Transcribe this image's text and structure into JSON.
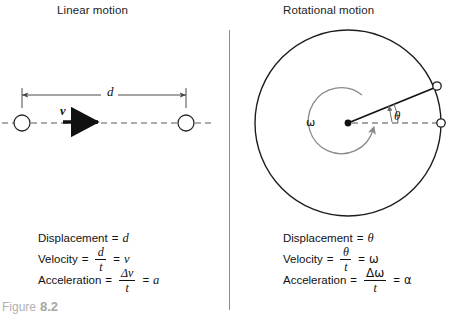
{
  "figure": {
    "caption_prefix": "Figure",
    "caption_number": "8.2",
    "scan_artifact": ""
  },
  "panels": {
    "left": {
      "title": "Linear motion",
      "diagram": {
        "distance_label": "d",
        "velocity_label": "v",
        "marker_left": "particle-start",
        "marker_right": "particle-end"
      },
      "equations": [
        {
          "name": "displacement",
          "label": "Displacement",
          "equals": "=",
          "result": "d",
          "has_fraction": false
        },
        {
          "name": "velocity",
          "label": "Velocity",
          "equals": "=",
          "numerator": "d",
          "denominator": "t",
          "equals2": "=",
          "result": "v",
          "has_fraction": true
        },
        {
          "name": "acceleration",
          "label": "Acceleration",
          "equals": "=",
          "numerator": "Δv",
          "denominator": "t",
          "equals2": "=",
          "result": "a",
          "has_fraction": true
        }
      ]
    },
    "right": {
      "title": "Rotational motion",
      "diagram": {
        "angular_velocity_label": "ω",
        "angle_label": "θ",
        "marker_center": "rotation-center",
        "marker_moved": "point-after-rotation",
        "marker_reference": "point-reference"
      },
      "equations": [
        {
          "name": "displacement",
          "label": "Displacement",
          "equals": "=",
          "result": "θ",
          "has_fraction": false
        },
        {
          "name": "velocity",
          "label": "Velocity",
          "equals": "=",
          "numerator": "θ",
          "denominator": "t",
          "equals2": "=",
          "result": "ω",
          "has_fraction": true
        },
        {
          "name": "acceleration",
          "label": "Acceleration",
          "equals": "=",
          "numerator": "Δω",
          "denominator": "t",
          "equals2": "=",
          "result": "α",
          "has_fraction": true
        }
      ]
    }
  },
  "colors": {
    "ink": "#111111",
    "divider": "#8d8d8d",
    "spiral": "#8a8a8a",
    "dimension_line": "#4a4a4a",
    "background": "#ffffff"
  }
}
